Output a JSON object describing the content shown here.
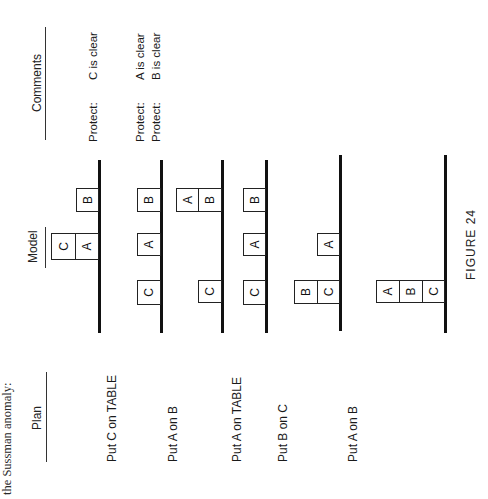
{
  "intro_text": "the Sussman anomaly:",
  "headers": {
    "plan": "Plan",
    "model": "Model",
    "comments": "Comments"
  },
  "rows": [
    {
      "plan": "",
      "comments": [
        {
          "label": "Protect:",
          "value": "C is clear"
        }
      ],
      "model": {
        "stacks": [
          [
            "A",
            "C"
          ],
          [
            "B"
          ]
        ]
      }
    },
    {
      "plan": "Put C on TABLE",
      "comments": [
        {
          "label": "Protect:",
          "value": "A is clear"
        },
        {
          "label": "Protect:",
          "value": "B is clear"
        }
      ],
      "model": {
        "stacks": [
          [
            "C"
          ],
          [
            "A"
          ],
          [
            "B"
          ]
        ]
      }
    },
    {
      "plan": "Put A on B",
      "comments": [],
      "model": {
        "stacks": [
          [
            "C"
          ],
          [
            "B",
            "A"
          ]
        ]
      }
    },
    {
      "plan": "Put A on TABLE",
      "comments": [],
      "model": {
        "stacks": [
          [
            "C"
          ],
          [
            "A"
          ],
          [
            "B"
          ]
        ]
      }
    },
    {
      "plan": "Put B on C",
      "comments": [],
      "model": {
        "stacks": [
          [
            "C",
            "B"
          ],
          [
            "A"
          ]
        ]
      }
    },
    {
      "plan": "Put A on B",
      "comments": [],
      "model": {
        "stacks": [
          [
            "C",
            "B",
            "A"
          ]
        ]
      }
    }
  ],
  "caption": "FIGURE 24"
}
